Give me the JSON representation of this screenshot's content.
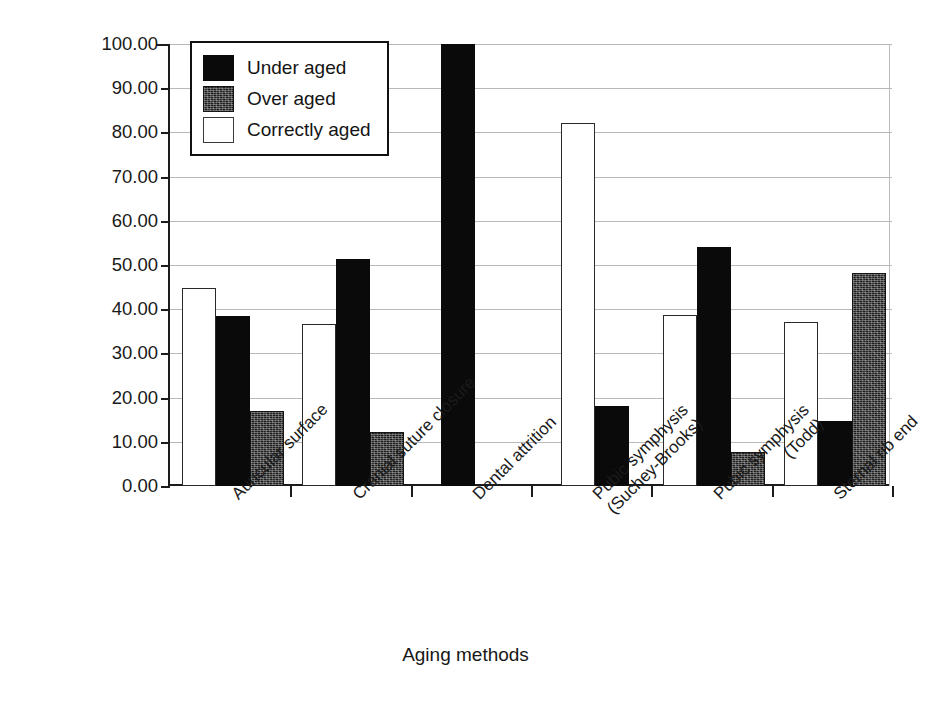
{
  "chart_data": {
    "type": "bar",
    "title": "",
    "xlabel": "Aging methods",
    "ylabel": "Percentage accuracy (%)",
    "ylim": [
      0,
      100
    ],
    "ytick_step": 10,
    "ytick_labels": [
      "0.00",
      "10.00",
      "20.00",
      "30.00",
      "40.00",
      "50.00",
      "60.00",
      "70.00",
      "80.00",
      "90.00",
      "100.00"
    ],
    "grid": "horizontal",
    "legend_position": "upper-left-inside",
    "categories": [
      "Auricular surface",
      "Cranial suture closure",
      "Dental attrition",
      "Pubic symphysis (Suchey-Brooks)",
      "Pubic symphysis (Todd)",
      "Sternal rib end"
    ],
    "category_label_lines": [
      [
        "Auricular surface"
      ],
      [
        "Cranial suture closure"
      ],
      [
        "Dental attrition"
      ],
      [
        "Pubic symphysis",
        "(Suchey-Brooks)"
      ],
      [
        "Pubic symphysis",
        "(Todd)"
      ],
      [
        "Sternal rib end"
      ]
    ],
    "series": [
      {
        "name": "Correctly aged",
        "key": "correct",
        "fill": "#ffffff",
        "values": [
          44.7,
          36.7,
          null,
          82.2,
          38.7,
          37.0
        ]
      },
      {
        "name": "Under aged",
        "key": "under",
        "fill": "#0a0a0a",
        "values": [
          38.5,
          51.3,
          100.0,
          18.0,
          54.0,
          14.8
        ]
      },
      {
        "name": "Over aged",
        "key": "over",
        "fill": "#1b1b1b",
        "values": [
          17.0,
          12.2,
          null,
          null,
          7.8,
          48.3
        ]
      }
    ],
    "draw_order": [
      "correct",
      "under",
      "over"
    ]
  },
  "legend": {
    "items": [
      {
        "label": "Under aged",
        "swatch": "solid-black-swatch"
      },
      {
        "label": "Over aged",
        "swatch": "textured-dark-swatch"
      },
      {
        "label": "Correctly aged",
        "swatch": "white-outlined-swatch"
      }
    ]
  },
  "axes": {
    "y_title": "Percentage accuracy (%)",
    "x_title": "Aging methods"
  }
}
